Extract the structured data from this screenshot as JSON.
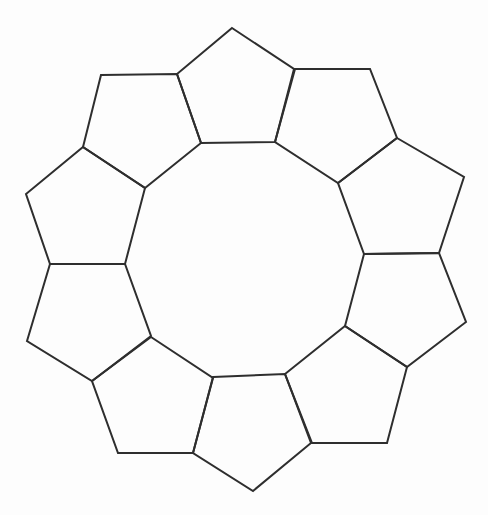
{
  "diagram": {
    "shape_count": 10,
    "shape_type": "pentagon",
    "stroke_color": "#2e2e2e",
    "background_color": "#fdfdfd",
    "stroke_width": 2,
    "pentagons": [
      {
        "id": "top",
        "points": [
          [
            232,
            28
          ],
          [
            294,
            69
          ],
          [
            275,
            142
          ],
          [
            201,
            143
          ],
          [
            177,
            74
          ]
        ]
      },
      {
        "id": "top-right",
        "points": [
          [
            295,
            69
          ],
          [
            370,
            69
          ],
          [
            397,
            138
          ],
          [
            338,
            183
          ],
          [
            275,
            142
          ]
        ]
      },
      {
        "id": "right-upper",
        "points": [
          [
            397,
            138
          ],
          [
            464,
            177
          ],
          [
            439,
            253
          ],
          [
            364,
            254
          ],
          [
            338,
            183
          ]
        ]
      },
      {
        "id": "right-lower",
        "points": [
          [
            364,
            254
          ],
          [
            439,
            253
          ],
          [
            466,
            322
          ],
          [
            407,
            367
          ],
          [
            345,
            326
          ]
        ]
      },
      {
        "id": "bottom-right",
        "points": [
          [
            345,
            326
          ],
          [
            407,
            367
          ],
          [
            387,
            443
          ],
          [
            312,
            443
          ],
          [
            285,
            374
          ]
        ]
      },
      {
        "id": "bottom",
        "points": [
          [
            213,
            377
          ],
          [
            285,
            374
          ],
          [
            311,
            443
          ],
          [
            253,
            491
          ],
          [
            193,
            453
          ]
        ]
      },
      {
        "id": "bottom-left",
        "points": [
          [
            151,
            337
          ],
          [
            213,
            378
          ],
          [
            193,
            453
          ],
          [
            118,
            453
          ],
          [
            92,
            381
          ]
        ]
      },
      {
        "id": "left-lower",
        "points": [
          [
            50,
            264
          ],
          [
            125,
            264
          ],
          [
            151,
            336
          ],
          [
            92,
            381
          ],
          [
            27,
            341
          ]
        ]
      },
      {
        "id": "left-upper",
        "points": [
          [
            83,
            147
          ],
          [
            145,
            188
          ],
          [
            125,
            264
          ],
          [
            50,
            264
          ],
          [
            26,
            194
          ]
        ]
      },
      {
        "id": "top-left",
        "points": [
          [
            101,
            75
          ],
          [
            177,
            74
          ],
          [
            201,
            143
          ],
          [
            145,
            188
          ],
          [
            83,
            147
          ]
        ]
      }
    ]
  }
}
